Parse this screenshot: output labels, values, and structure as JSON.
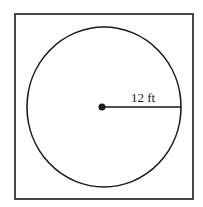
{
  "diagram": {
    "shapes": {
      "square": {
        "x": 15,
        "y": 14,
        "width": 178,
        "height": 185,
        "stroke": "#1a1a1a"
      },
      "circle": {
        "cx": 104,
        "cy": 107,
        "rx": 77,
        "ry": 80,
        "stroke": "#1a1a1a"
      },
      "center_point": {
        "cx": 102,
        "cy": 107,
        "r": 3.5
      },
      "radius_line": {
        "x1": 102,
        "y1": 107,
        "x2": 181,
        "y2": 107
      }
    },
    "radius_label": "12 ft"
  }
}
